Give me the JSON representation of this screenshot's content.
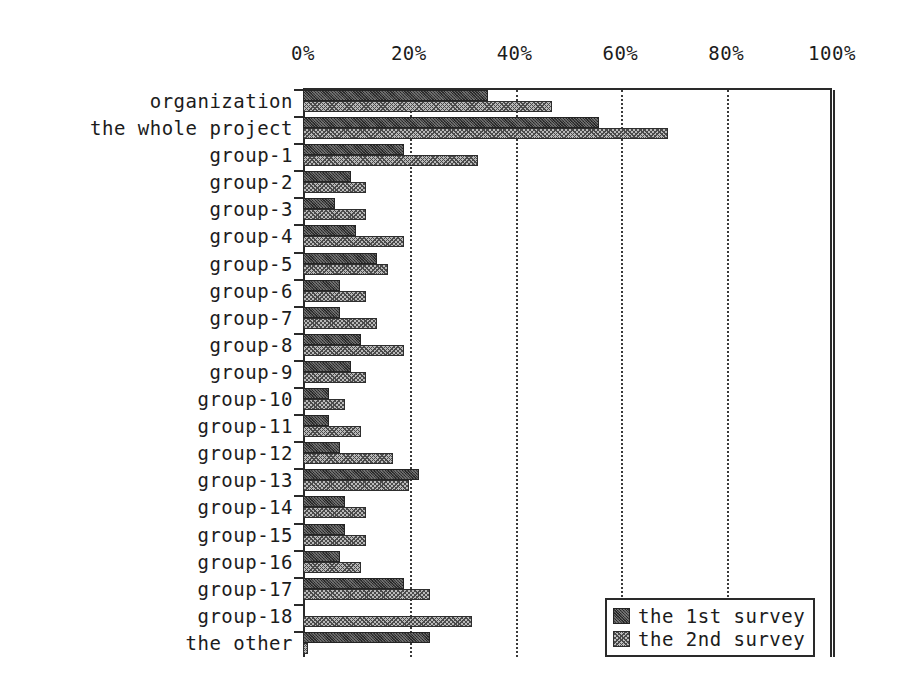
{
  "chart_data": {
    "type": "bar",
    "orientation": "horizontal",
    "title": "",
    "xlabel": "",
    "ylabel": "",
    "xlim": [
      0,
      100
    ],
    "xticks": [
      "0%",
      "20%",
      "40%",
      "60%",
      "80%",
      "100%"
    ],
    "xtick_values": [
      0,
      20,
      40,
      60,
      80,
      100
    ],
    "grid": true,
    "grid_axis": "x",
    "legend_position": "bottom-right",
    "categories": [
      "organization",
      "the whole project",
      "group-1",
      "group-2",
      "group-3",
      "group-4",
      "group-5",
      "group-6",
      "group-7",
      "group-8",
      "group-9",
      "group-10",
      "group-11",
      "group-12",
      "group-13",
      "group-14",
      "group-15",
      "group-16",
      "group-17",
      "group-18",
      "the other"
    ],
    "series": [
      {
        "name": "the 1st survey",
        "color": "#3b3b3b",
        "values": [
          35,
          56,
          19,
          9,
          6,
          10,
          14,
          7,
          7,
          11,
          9,
          5,
          5,
          7,
          22,
          8,
          8,
          7,
          19,
          0,
          24
        ]
      },
      {
        "name": "the 2nd survey",
        "color": "#bdbdbd",
        "values": [
          47,
          69,
          33,
          12,
          12,
          19,
          16,
          12,
          14,
          19,
          12,
          8,
          11,
          17,
          20,
          12,
          12,
          11,
          24,
          32,
          1
        ]
      }
    ]
  },
  "legend": {
    "items": [
      {
        "label": "the 1st survey",
        "swatch": "s1"
      },
      {
        "label": "the 2nd survey",
        "swatch": "s2"
      }
    ]
  }
}
